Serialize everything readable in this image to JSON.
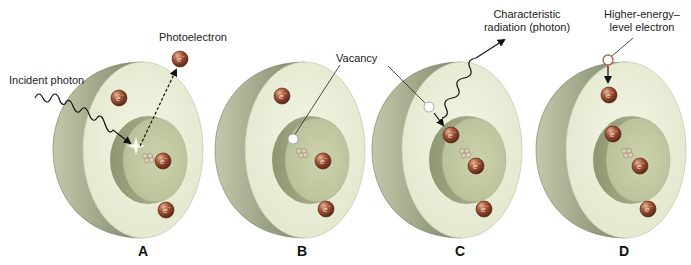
{
  "figure": {
    "electron_symbol": "e",
    "electron_charge": "−",
    "colors": {
      "shell_face": "#ecefd9",
      "shell_side": "#a9b08e",
      "inner_disc": "#c9cfa8",
      "inner_side": "#a6ad84",
      "electron": "#9a4e33",
      "vacancy": "#ffffff",
      "line": "#222222"
    },
    "panels": [
      {
        "id": "A",
        "letter": "A",
        "labels": [
          "Incident photon",
          "Photoelectron"
        ]
      },
      {
        "id": "B",
        "letter": "B",
        "labels": [
          "Vacancy"
        ]
      },
      {
        "id": "C",
        "letter": "C",
        "labels": [
          "Vacancy",
          "Characteristic radiation (photon)"
        ]
      },
      {
        "id": "D",
        "letter": "D",
        "labels": [
          "Higher-energy–level electron"
        ]
      }
    ]
  },
  "labels": {
    "incident_photon": "Incident photon",
    "photoelectron": "Photoelectron",
    "vacancy_b": "Vacancy",
    "vacancy_c": "Vacancy",
    "characteristic_line1": "Characteristic",
    "characteristic_line2": "radiation (photon)",
    "higher_line1": "Higher-energy–",
    "higher_line2": "level electron"
  },
  "panel_letters": {
    "a": "A",
    "b": "B",
    "c": "C",
    "d": "D"
  }
}
